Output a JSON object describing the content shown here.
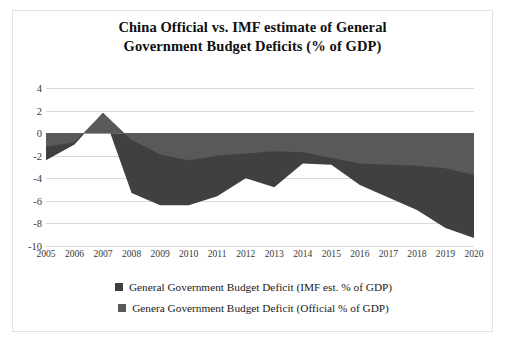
{
  "chart_data": {
    "type": "area",
    "title": "China Official vs. IMF estimate of General Government Budget Deficits (% of GDP)",
    "title_line1": "China Official vs. IMF estimate of General",
    "title_line2": "Government Budget Deficits (% of GDP)",
    "xlabel": "",
    "ylabel": "",
    "grid": true,
    "legend_position": "bottom",
    "ylim": [
      -10,
      4
    ],
    "yticks": [
      "4",
      "2",
      "0",
      "-2",
      "-4",
      "-6",
      "-8",
      "-10"
    ],
    "ytick_values": [
      4,
      2,
      0,
      -2,
      -4,
      -6,
      -8,
      -10
    ],
    "categories": [
      "2005",
      "2006",
      "2007",
      "2008",
      "2009",
      "2010",
      "2011",
      "2012",
      "2013",
      "2014",
      "2015",
      "2016",
      "2017",
      "2018",
      "2019",
      "2020"
    ],
    "x": [
      2005,
      2006,
      2007,
      2008,
      2009,
      2010,
      2011,
      2012,
      2013,
      2014,
      2015,
      2016,
      2017,
      2018,
      2019,
      2020
    ],
    "series": [
      {
        "name": "General Government Budget Deficit (IMF est. % of GDP)",
        "color": "#404040",
        "values": [
          -2.4,
          -1.0,
          1.8,
          -5.3,
          -6.4,
          -6.4,
          -5.6,
          -4.0,
          -4.8,
          -2.7,
          -2.8,
          -4.6,
          -5.7,
          -6.8,
          -8.4,
          -9.3
        ]
      },
      {
        "name": "Genera Government Budget Deficit (Official % of GDP)",
        "color": "#595959",
        "values": [
          -1.2,
          -0.8,
          1.8,
          -0.6,
          -1.9,
          -2.4,
          -2.0,
          -1.8,
          -1.6,
          -1.7,
          -2.2,
          -2.7,
          -2.8,
          -2.9,
          -3.1,
          -3.7
        ]
      }
    ]
  },
  "legend": {
    "items": [
      {
        "label": "General Government Budget Deficit (IMF est. % of GDP)",
        "color": "#404040"
      },
      {
        "label": "Genera Government Budget Deficit (Official % of GDP)",
        "color": "#595959"
      }
    ]
  },
  "colors": {
    "imf_area": "#404040",
    "official_area": "#595959",
    "gridline": "#d9d9d9",
    "axis_text": "#3a3a3a",
    "title_text": "#0f0f0f",
    "frame_border": "#e2e2e2",
    "background": "#ffffff"
  }
}
